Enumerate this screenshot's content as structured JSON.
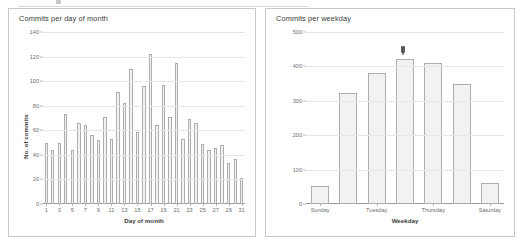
{
  "page": {
    "background": "#ffffff",
    "bar_fill": "#f2f2f2",
    "bar_stroke": "#adadad",
    "grid_color": "#e6e6e6",
    "axis_color": "#9b9b9b",
    "text_color": "#3a3a3a",
    "tick_text_color": "#6d6d6d"
  },
  "panels": {
    "left": {
      "title": "Commits per day of month"
    },
    "right": {
      "title": "Commits per weekday"
    }
  },
  "marker": {
    "name": "hover-cursor-marker"
  },
  "chart_data": [
    {
      "id": "commits-per-day-of-month",
      "type": "bar",
      "title": "Commits per day of month",
      "xlabel": "Day of month",
      "ylabel": "No. of commits",
      "ylim": [
        0,
        140
      ],
      "yticks": [
        0,
        20,
        40,
        60,
        80,
        100,
        120,
        140
      ],
      "grid": true,
      "legend": false,
      "categories": [
        "1",
        "2",
        "3",
        "4",
        "5",
        "6",
        "7",
        "8",
        "9",
        "10",
        "11",
        "12",
        "13",
        "14",
        "15",
        "16",
        "17",
        "18",
        "19",
        "20",
        "21",
        "22",
        "23",
        "24",
        "25",
        "26",
        "27",
        "28",
        "29",
        "30",
        "31"
      ],
      "xtick_labels": [
        "1",
        "3",
        "5",
        "7",
        "9",
        "11",
        "13",
        "15",
        "17",
        "19",
        "21",
        "23",
        "25",
        "27",
        "29",
        "31"
      ],
      "values": [
        50,
        44,
        50,
        73,
        44,
        66,
        64,
        56,
        52,
        71,
        53,
        91,
        82,
        110,
        59,
        96,
        122,
        64,
        97,
        71,
        115,
        53,
        69,
        66,
        49,
        44,
        46,
        48,
        33,
        37,
        21
      ]
    },
    {
      "id": "commits-per-weekday",
      "type": "bar",
      "title": "Commits per weekday",
      "xlabel": "Weekday",
      "ylabel": "No. of commits",
      "ylim": [
        0,
        500
      ],
      "yticks": [
        0,
        100,
        200,
        300,
        400,
        500
      ],
      "grid": true,
      "legend": false,
      "categories": [
        "Sunday",
        "Monday",
        "Tuesday",
        "Wednesday",
        "Thursday",
        "Friday",
        "Saturday"
      ],
      "xtick_labels": [
        "Sunday",
        "Tuesday",
        "Thursday",
        "Saturday"
      ],
      "xtick_indices": [
        0,
        2,
        4,
        6
      ],
      "values": [
        53,
        322,
        381,
        422,
        411,
        350,
        60
      ]
    }
  ]
}
